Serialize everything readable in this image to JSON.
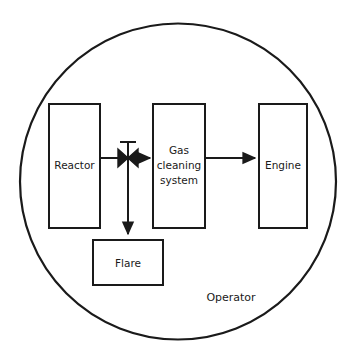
{
  "diagram": {
    "type": "process-flow-block-diagram",
    "background_color": "#ffffff",
    "stroke_color": "#1a1a1a",
    "boundary": {
      "shape": "circle",
      "label": "Operator",
      "center_x": 178,
      "center_y": 181,
      "radius": 158
    },
    "nodes": [
      {
        "id": "reactor",
        "label": "Reactor",
        "label_lines": [
          "Reactor"
        ],
        "shape": "rectangle",
        "x": 49,
        "y": 104,
        "width": 51,
        "height": 124
      },
      {
        "id": "gas-cleaning-system",
        "label": "Gas cleaning system",
        "label_lines": [
          "Gas",
          "cleaning",
          "system"
        ],
        "shape": "rectangle",
        "x": 153,
        "y": 104,
        "width": 52,
        "height": 124
      },
      {
        "id": "engine",
        "label": "Engine",
        "label_lines": [
          "Engine"
        ],
        "shape": "rectangle",
        "x": 259,
        "y": 104,
        "width": 48,
        "height": 124
      },
      {
        "id": "flare",
        "label": "Flare",
        "label_lines": [
          "Flare"
        ],
        "shape": "rectangle",
        "x": 93,
        "y": 240,
        "width": 70,
        "height": 45
      }
    ],
    "valve": {
      "id": "three-way-valve",
      "symbol": "butterfly-valve",
      "x": 128,
      "y": 158
    },
    "connections": [
      {
        "id": "reactor-to-valve",
        "from": "reactor",
        "to": "three-way-valve",
        "orientation": "horizontal",
        "arrowhead": false
      },
      {
        "id": "valve-to-gas-cleaning",
        "from": "three-way-valve",
        "to": "gas-cleaning-system",
        "orientation": "horizontal",
        "arrowhead": true
      },
      {
        "id": "gas-cleaning-to-engine",
        "from": "gas-cleaning-system",
        "to": "engine",
        "orientation": "horizontal",
        "arrowhead": true
      },
      {
        "id": "valve-to-flare",
        "from": "three-way-valve",
        "to": "flare",
        "orientation": "vertical",
        "arrowhead": true
      }
    ]
  }
}
